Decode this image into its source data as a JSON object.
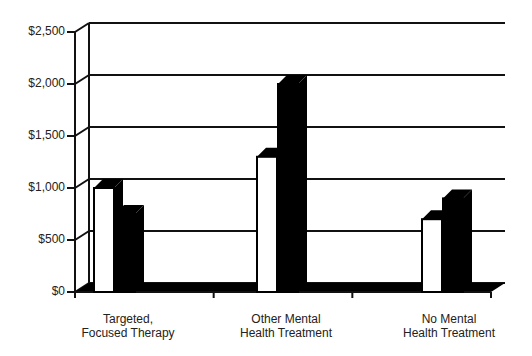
{
  "chart_data": {
    "type": "bar",
    "style": "3d-clustered",
    "title": "",
    "xlabel": "",
    "ylabel": "",
    "categories": [
      "Targeted, Focused Therapy",
      "Other Mental Health Treatment",
      "No Mental Health Treatment"
    ],
    "category_lines": [
      [
        "Targeted,",
        "Focused Therapy"
      ],
      [
        "Other Mental",
        "Health Treatment"
      ],
      [
        "No Mental",
        "Health Treatment"
      ]
    ],
    "series": [
      {
        "name": "Series 1 (white)",
        "color": "#ffffff",
        "values": [
          1000,
          1300,
          700
        ]
      },
      {
        "name": "Series 2 (black)",
        "color": "#000000",
        "values": [
          750,
          2000,
          900
        ]
      }
    ],
    "ylim": [
      0,
      2500
    ],
    "yticks": [
      0,
      500,
      1000,
      1500,
      2000,
      2500
    ],
    "ytick_labels": [
      "$0",
      "$500",
      "$1,000",
      "$1,500",
      "$2,000",
      "$2,500"
    ],
    "grid": true,
    "legend": "none"
  }
}
